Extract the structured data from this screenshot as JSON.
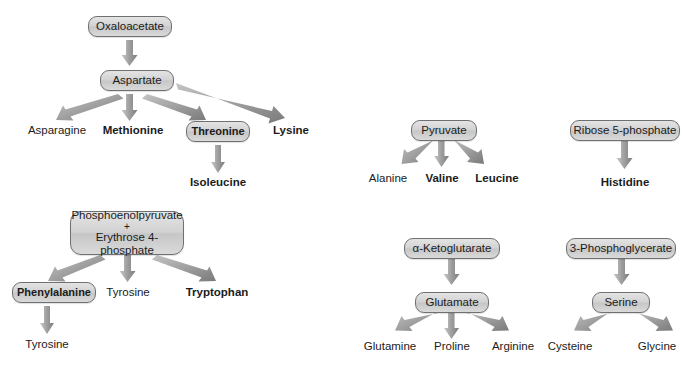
{
  "figure": {
    "background_color": "#ffffff",
    "node_fill_color": "#d2d2d2",
    "node_border_color": "#6f7072",
    "arrow_color": "#8c8c8c",
    "text_color": "#1b1b1b"
  },
  "pathways": {
    "oxaloacetate": {
      "root": {
        "label": "Oxaloacetate",
        "boxed": true,
        "bold": false
      },
      "intermediate": {
        "label": "Aspartate",
        "boxed": true,
        "bold": false
      },
      "products": [
        {
          "label": "Asparagine",
          "boxed": false,
          "bold": false
        },
        {
          "label": "Methionine",
          "boxed": false,
          "bold": true
        },
        {
          "label": "Threonine",
          "boxed": true,
          "bold": true
        },
        {
          "label": "Lysine",
          "boxed": false,
          "bold": true
        }
      ],
      "terminal": {
        "label": "Isoleucine",
        "boxed": false,
        "bold": true
      }
    },
    "pep_erythrose": {
      "root": {
        "line1": "Phosphoenolpyruvate",
        "plus": "+",
        "line2": "Erythrose 4-phosphate",
        "boxed": true
      },
      "products": [
        {
          "label": "Phenylalanine",
          "boxed": true,
          "bold": true
        },
        {
          "label": "Tyrosine",
          "boxed": false,
          "bold": false
        },
        {
          "label": "Tryptophan",
          "boxed": false,
          "bold": true
        }
      ],
      "terminal": {
        "label": "Tyrosine",
        "boxed": false,
        "bold": false
      }
    },
    "pyruvate": {
      "root": {
        "label": "Pyruvate",
        "boxed": true,
        "bold": false
      },
      "products": [
        {
          "label": "Alanine",
          "boxed": false,
          "bold": false
        },
        {
          "label": "Valine",
          "boxed": false,
          "bold": true
        },
        {
          "label": "Leucine",
          "boxed": false,
          "bold": true
        }
      ]
    },
    "ribose_5_phosphate": {
      "root": {
        "label": "Ribose 5-phosphate",
        "boxed": true,
        "bold": false
      },
      "products": [
        {
          "label": "Histidine",
          "boxed": false,
          "bold": true
        }
      ]
    },
    "alpha_ketoglutarate": {
      "root": {
        "label": "α-Ketoglutarate",
        "boxed": true,
        "bold": false
      },
      "intermediate": {
        "label": "Glutamate",
        "boxed": true,
        "bold": false
      },
      "products": [
        {
          "label": "Glutamine",
          "boxed": false,
          "bold": false
        },
        {
          "label": "Proline",
          "boxed": false,
          "bold": false
        },
        {
          "label": "Arginine",
          "boxed": false,
          "bold": false
        }
      ]
    },
    "phosphoglycerate": {
      "root": {
        "label": "3-Phosphoglycerate",
        "boxed": true,
        "bold": false
      },
      "intermediate": {
        "label": "Serine",
        "boxed": true,
        "bold": false
      },
      "products": [
        {
          "label": "Cysteine",
          "boxed": false,
          "bold": false
        },
        {
          "label": "Glycine",
          "boxed": false,
          "bold": false
        }
      ]
    }
  }
}
